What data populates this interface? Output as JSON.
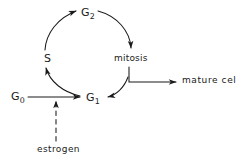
{
  "diagram": {
    "stroke_color": "#1a1a1a",
    "text_color": "#1a1a1a",
    "background_color": "#ffffff",
    "nodes": [
      {
        "id": "g2",
        "label_main": "G",
        "label_sub": "2",
        "text": "G2"
      },
      {
        "id": "s",
        "label_main": "S",
        "label_sub": "",
        "text": "S"
      },
      {
        "id": "mitosis",
        "label_main": "mitosis",
        "label_sub": "",
        "text": "mitosis"
      },
      {
        "id": "g1",
        "label_main": "G",
        "label_sub": "1",
        "text": "G1"
      },
      {
        "id": "g0",
        "label_main": "G",
        "label_sub": "0",
        "text": "G0"
      },
      {
        "id": "mature",
        "label_main": "mature cells",
        "label_sub": "",
        "text": "mature cells"
      },
      {
        "id": "estrogen",
        "label_main": "estrogen",
        "label_sub": "",
        "text": "estrogen"
      }
    ],
    "edges": [
      {
        "from": "s",
        "to": "g2",
        "style": "solid-curve",
        "arrow": "end"
      },
      {
        "from": "g2",
        "to": "mitosis",
        "style": "solid-curve",
        "arrow": "end"
      },
      {
        "from": "mitosis",
        "to": "g1",
        "style": "solid-curve",
        "arrow": "end"
      },
      {
        "from": "g1",
        "to": "s",
        "style": "solid-curve",
        "arrow": "end"
      },
      {
        "from": "mitosis",
        "to": "mature",
        "style": "solid-elbow",
        "arrow": "end"
      },
      {
        "from": "g0",
        "to": "g1",
        "style": "solid-straight",
        "arrow": "end"
      },
      {
        "from": "estrogen",
        "to": "g0-g1-line",
        "style": "dashed-vertical",
        "arrow": "end"
      }
    ]
  }
}
